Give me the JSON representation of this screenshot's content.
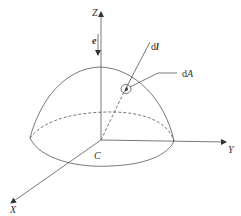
{
  "diagram": {
    "type": "hemisphere-coordinate-diagram",
    "axes": {
      "z_label": "Z",
      "y_label": "Y",
      "x_label": "X"
    },
    "labels": {
      "direction_vector": "e",
      "curve": "C",
      "line_element_prefix": "d",
      "line_element_symbol": "l",
      "area_element_prefix": "d",
      "area_element_symbol": "A"
    },
    "colors": {
      "stroke": "#555555",
      "text": "#333333",
      "background": "#ffffff"
    }
  }
}
